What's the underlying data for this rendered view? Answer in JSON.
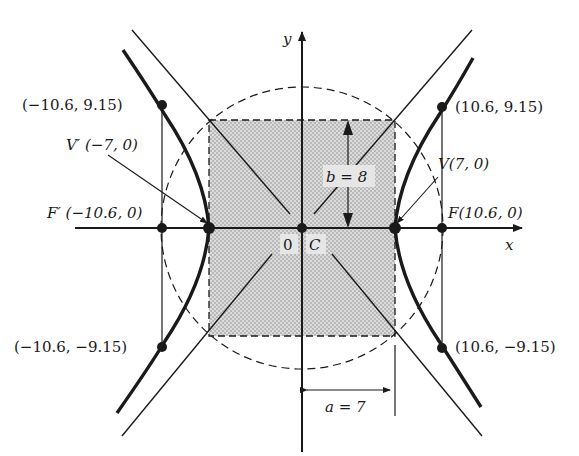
{
  "diagram": {
    "type": "hyperbola",
    "axes": {
      "x_label": "x",
      "y_label": "y"
    },
    "origin_label": "0",
    "center_label": "C",
    "parameters": {
      "a_label": "a = 7",
      "b_label": "b = 8",
      "a": 7,
      "b": 8,
      "c": 10.6
    },
    "vertices": [
      {
        "name": "V",
        "label": "V(7, 0)",
        "x": 7,
        "y": 0
      },
      {
        "name": "V'",
        "label": "V′ (−7, 0)",
        "x": -7,
        "y": 0
      }
    ],
    "foci": [
      {
        "name": "F",
        "label": "F(10.6, 0)",
        "x": 10.6,
        "y": 0
      },
      {
        "name": "F'",
        "label": "F′ (−10.6, 0)",
        "x": -10.6,
        "y": 0
      }
    ],
    "latus_points": [
      {
        "label": "(10.6, 9.15)",
        "x": 10.6,
        "y": 9.15
      },
      {
        "label": "(−10.6, 9.15)",
        "x": -10.6,
        "y": 9.15
      },
      {
        "label": "(10.6, −9.15)",
        "x": 10.6,
        "y": -9.15
      },
      {
        "label": "(−10.6, −9.15)",
        "x": -10.6,
        "y": -9.15
      }
    ],
    "features": [
      "central rectangle 2a by 2b (shaded)",
      "asymptotes through rectangle corners",
      "dashed circle radius c",
      "latus rectum segments"
    ],
    "colors": {
      "ink": "#1a1a1a",
      "shade": "#cfcfcf",
      "paper": "#ffffff"
    }
  }
}
